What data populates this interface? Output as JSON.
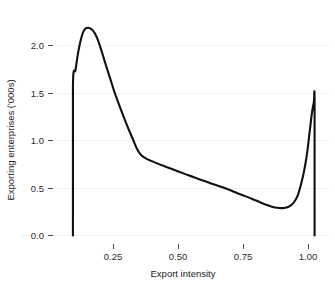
{
  "chart_data": {
    "type": "line",
    "title": "",
    "subtitle": "",
    "xlabel": "Export intensity",
    "ylabel": "Exporting enterprises ('000s)",
    "xlim": [
      0.0,
      1.06
    ],
    "ylim": [
      0.0,
      2.42
    ],
    "xticks": [
      0.25,
      0.5,
      0.75,
      1.0
    ],
    "xtick_labels": [
      "0.25",
      "0.50",
      "0.75",
      "1.00"
    ],
    "yticks": [
      0.0,
      0.5,
      1.0,
      1.5,
      2.0
    ],
    "ytick_labels": [
      "0.0",
      "0.5",
      "1.0",
      "1.5",
      "2.0"
    ],
    "grid": "horizontal",
    "grid_color": "#f1f1f1",
    "legend": "none",
    "series": [
      {
        "name": "Exporting enterprises density",
        "color": "#111111",
        "line_width": 2.1,
        "x": [
          0.06,
          0.06,
          0.07,
          0.08,
          0.09,
          0.1,
          0.11,
          0.12,
          0.13,
          0.135,
          0.145,
          0.155,
          0.165,
          0.175,
          0.19,
          0.205,
          0.22,
          0.235,
          0.25,
          0.265,
          0.28,
          0.295,
          0.31,
          0.325,
          0.345,
          0.365,
          0.39,
          0.415,
          0.44,
          0.47,
          0.5,
          0.53,
          0.56,
          0.595,
          0.63,
          0.665,
          0.7,
          0.73,
          0.76,
          0.79,
          0.815,
          0.835,
          0.855,
          0.875,
          0.89,
          0.905,
          0.92,
          0.935,
          0.95,
          0.962,
          0.972,
          0.982,
          0.99,
          0.997,
          1.0,
          1.0
        ],
        "y": [
          0.0,
          1.65,
          1.84,
          2.03,
          2.17,
          2.265,
          2.305,
          2.312,
          2.3,
          2.29,
          2.25,
          2.19,
          2.11,
          2.02,
          1.88,
          1.745,
          1.61,
          1.49,
          1.375,
          1.265,
          1.16,
          1.06,
          0.96,
          0.895,
          0.855,
          0.83,
          0.8,
          0.772,
          0.745,
          0.712,
          0.68,
          0.648,
          0.618,
          0.582,
          0.548,
          0.512,
          0.47,
          0.438,
          0.404,
          0.368,
          0.34,
          0.32,
          0.308,
          0.305,
          0.312,
          0.33,
          0.37,
          0.45,
          0.6,
          0.76,
          0.94,
          1.18,
          1.37,
          1.48,
          1.495,
          0.0
        ]
      }
    ],
    "annotations": {
      "peak_value": 2.31,
      "peak_x": 0.135,
      "minimum_value": 0.305,
      "minimum_x": 0.875,
      "left_edge_value": 1.65,
      "right_edge_value": 1.49
    }
  }
}
